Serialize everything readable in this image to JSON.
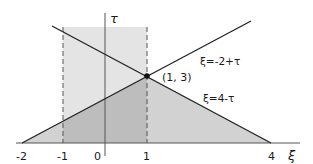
{
  "figure": {
    "x_axis": {
      "label": "ξ",
      "ticks": [
        "-2",
        "-1",
        "0",
        "1",
        "4"
      ]
    },
    "y_axis": {
      "label": "τ"
    },
    "lines": [
      {
        "label": "ξ=-2+τ"
      },
      {
        "label": "ξ=4-τ"
      }
    ],
    "intersection": {
      "label": "(1, 3)"
    },
    "colors": {
      "triangle_fill": "#d2d2d2",
      "rect_fill": "#e4e4e4",
      "overlap_fill": "#bdbdbd",
      "line": "#222222",
      "axis": "#555555"
    }
  }
}
